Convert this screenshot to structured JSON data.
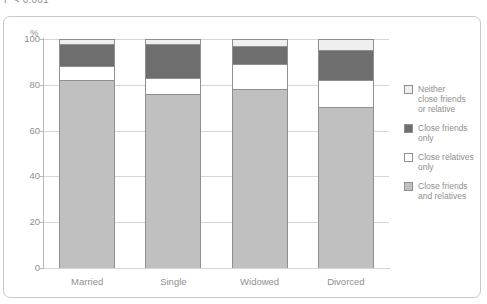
{
  "annotation": {
    "pvalue": "P < 0.001"
  },
  "chart_data": {
    "type": "bar",
    "subtype": "stacked-100-percent",
    "title": "",
    "xlabel": "",
    "ylabel": "%",
    "ylim": [
      0,
      100
    ],
    "yticks": [
      0,
      20,
      40,
      60,
      80,
      100
    ],
    "grid": true,
    "legend_position": "right",
    "categories": [
      "Married",
      "Single",
      "Widowed",
      "Divorced"
    ],
    "series": [
      {
        "name": "Close friends and relatives",
        "key": "both",
        "color": "#c0c0c0",
        "values": [
          82,
          76,
          78,
          70
        ]
      },
      {
        "name": "Close relatives only",
        "key": "relatives",
        "color": "#ffffff",
        "values": [
          6,
          7,
          11,
          12
        ]
      },
      {
        "name": "Close friends only",
        "key": "friends",
        "color": "#6e6e6e",
        "values": [
          10,
          15,
          8,
          13
        ]
      },
      {
        "name": "Neither close friends or relative",
        "key": "neither",
        "color": "#efefef",
        "values": [
          2,
          2,
          3,
          5
        ]
      }
    ]
  },
  "axis": {
    "y_title": "%",
    "y_ticks": [
      "100",
      "80",
      "60",
      "40",
      "20",
      "0"
    ],
    "x_ticks": [
      "Married",
      "Single",
      "Widowed",
      "Divorced"
    ]
  },
  "legend": {
    "items": [
      {
        "label": "Neither\nclose friends\nor relative",
        "line1": "Neither",
        "line2": "close friends",
        "line3": "or relative",
        "swatch": "#efefef"
      },
      {
        "label": "Close friends\nonly",
        "line1": "Close friends",
        "line2": "only",
        "line3": "",
        "swatch": "#6e6e6e"
      },
      {
        "label": "Close relatives\nonly",
        "line1": "Close relatives",
        "line2": "only",
        "line3": "",
        "swatch": "#ffffff"
      },
      {
        "label": "Close friends\nand relatives",
        "line1": "Close friends",
        "line2": "and relatives",
        "line3": "",
        "swatch": "#c0c0c0"
      }
    ]
  }
}
